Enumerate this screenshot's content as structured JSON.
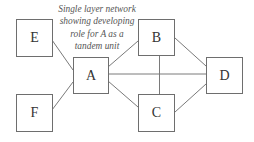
{
  "diagram": {
    "type": "network",
    "caption_lines": [
      "Single layer network",
      "showing developing",
      "role for A as a",
      "tandem unit"
    ],
    "nodes": [
      {
        "id": "E",
        "label": "E",
        "x": 16,
        "y": 19,
        "w": 37,
        "h": 38
      },
      {
        "id": "F",
        "label": "F",
        "x": 16,
        "y": 94,
        "w": 37,
        "h": 38
      },
      {
        "id": "A",
        "label": "A",
        "x": 73,
        "y": 57,
        "w": 36,
        "h": 37
      },
      {
        "id": "B",
        "label": "B",
        "x": 138,
        "y": 19,
        "w": 37,
        "h": 37
      },
      {
        "id": "C",
        "label": "C",
        "x": 138,
        "y": 94,
        "w": 37,
        "h": 38
      },
      {
        "id": "D",
        "label": "D",
        "x": 206,
        "y": 57,
        "w": 37,
        "h": 37
      }
    ],
    "edges": [
      {
        "from": "E",
        "to": "A",
        "x1": 52,
        "y1": 40,
        "x2": 73,
        "y2": 70
      },
      {
        "from": "F",
        "to": "A",
        "x1": 52,
        "y1": 110,
        "x2": 73,
        "y2": 82
      },
      {
        "from": "A",
        "to": "B",
        "x1": 108,
        "y1": 67,
        "x2": 138,
        "y2": 41
      },
      {
        "from": "A",
        "to": "D",
        "x1": 108,
        "y1": 74,
        "x2": 206,
        "y2": 74
      },
      {
        "from": "A",
        "to": "C",
        "x1": 108,
        "y1": 81,
        "x2": 138,
        "y2": 107
      },
      {
        "from": "B",
        "to": "C",
        "x1": 159.5,
        "y1": 56,
        "x2": 159.5,
        "y2": 94
      },
      {
        "from": "B",
        "to": "D",
        "x1": 175,
        "y1": 38,
        "x2": 206,
        "y2": 66
      },
      {
        "from": "C",
        "to": "D",
        "x1": 175,
        "y1": 112,
        "x2": 206,
        "y2": 84
      }
    ],
    "colors": {
      "line": "#7a7a7a",
      "border": "#6e6e6e",
      "label": "#333333",
      "caption": "#555555",
      "background": "#ffffff"
    }
  }
}
